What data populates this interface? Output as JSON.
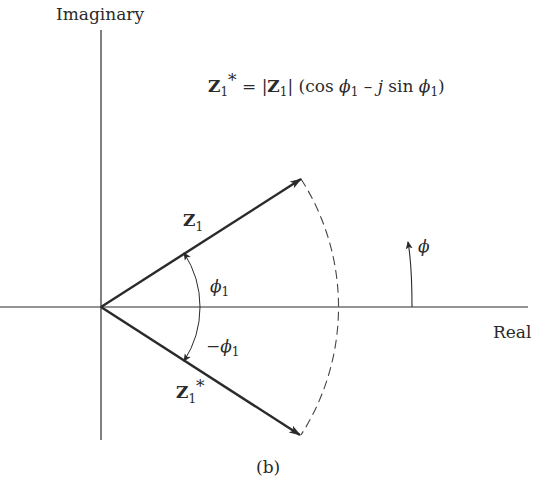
{
  "diagram": {
    "axis_labels": {
      "vertical": "Imaginary",
      "horizontal": "Real"
    },
    "equation": {
      "lhs_symbol": "Z",
      "lhs_sub": "1",
      "lhs_sup": "*",
      "equals": " = ",
      "abs_open": "|",
      "abs_symbol": "Z",
      "abs_sub": "1",
      "abs_close": "|",
      "part1": " (cos ",
      "phi1": "ϕ",
      "phi1_sub": "1",
      "minus": " – ",
      "j": "j",
      "part2": " sin ",
      "phi2": "ϕ",
      "phi2_sub": "1",
      "close": ")"
    },
    "vectors": {
      "z1": {
        "symbol": "Z",
        "sub": "1"
      },
      "z1_conj": {
        "symbol": "Z",
        "sub": "1",
        "sup": "*"
      }
    },
    "angles": {
      "phi1": {
        "symbol": "ϕ",
        "sub": "1"
      },
      "neg_phi1": {
        "prefix": "−",
        "symbol": "ϕ",
        "sub": "1"
      },
      "phi_direction": {
        "symbol": "ϕ"
      }
    },
    "caption": "(b)",
    "colors": {
      "ink": "#2a2a2a",
      "background": "#ffffff"
    }
  }
}
